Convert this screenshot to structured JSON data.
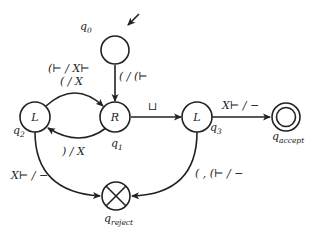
{
  "diagram": {
    "type": "state-machine",
    "states": [
      {
        "id": "q0",
        "name": "q",
        "sub": "0",
        "inner": "",
        "role": "start"
      },
      {
        "id": "q1",
        "name": "q",
        "sub": "1",
        "inner": "R",
        "role": "normal"
      },
      {
        "id": "q2",
        "name": "q",
        "sub": "2",
        "inner": "L",
        "role": "normal"
      },
      {
        "id": "q3",
        "name": "q",
        "sub": "3",
        "inner": "L",
        "role": "normal"
      },
      {
        "id": "q_accept",
        "name": "q",
        "sub": "accept",
        "inner": "",
        "role": "accept"
      },
      {
        "id": "q_reject",
        "name": "q",
        "sub": "reject",
        "inner": "",
        "role": "reject"
      }
    ],
    "transitions": [
      {
        "from": "q0",
        "to": "q1",
        "label": "( / (⊢"
      },
      {
        "from": "q2",
        "to": "q1",
        "label_line1": "(⊢ / X⊢",
        "label_line2": "( / X"
      },
      {
        "from": "q1",
        "to": "q2",
        "label": ") / X"
      },
      {
        "from": "q1",
        "to": "q3",
        "label": "⊔"
      },
      {
        "from": "q3",
        "to": "q_accept",
        "label": "X⊢ / −"
      },
      {
        "from": "q2",
        "to": "q_reject",
        "label": "X⊢ / −"
      },
      {
        "from": "q3",
        "to": "q_reject",
        "label": "( , (⊢ / −"
      }
    ]
  }
}
